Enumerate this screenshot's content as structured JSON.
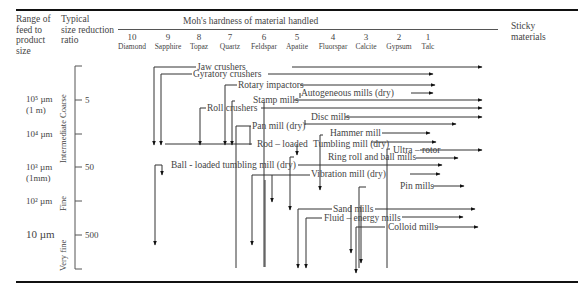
{
  "header": {
    "col1": [
      "Range of",
      "feed to",
      "product",
      "size"
    ],
    "col2": [
      "Typical",
      "size reduction",
      "ratio"
    ],
    "moh_title": "Moh's hardness of material handled",
    "sticky": [
      "Sticky",
      "materials"
    ],
    "hardness": [
      {
        "num": "10",
        "name": "Diamond"
      },
      {
        "num": "9",
        "name": "Sapphire"
      },
      {
        "num": "8",
        "name": "Topaz"
      },
      {
        "num": "7",
        "name": "Quartz"
      },
      {
        "num": "6",
        "name": "Feldspar"
      },
      {
        "num": "5",
        "name": "Apatite"
      },
      {
        "num": "4",
        "name": "Fluorspar"
      },
      {
        "num": "3",
        "name": "Calcite"
      },
      {
        "num": "2",
        "name": "Gypsum"
      },
      {
        "num": "1",
        "name": "Talc"
      }
    ]
  },
  "size_axis": {
    "sizes": [
      {
        "line1": "10⁵ µm",
        "line2": "(1 m)"
      },
      {
        "line1": "10⁴ µm",
        "line2": ""
      },
      {
        "line1": "10³ µm",
        "line2": "(1mm)"
      },
      {
        "line1": "10² µm",
        "line2": ""
      },
      {
        "line1": "10 µm",
        "line2": ""
      }
    ],
    "ratios": [
      "5",
      "50",
      "500"
    ],
    "categories": [
      "Intermediate Coarse",
      "Fine",
      "Very fine"
    ]
  },
  "equipment": [
    "Jaw crushers",
    "Gyratory crushers",
    "Rotary impactors",
    "Autogeneous mills (dry)",
    "Stamp mills",
    "Roll crushers",
    "Disc mills",
    "Pan mill (dry)",
    "Hammer mill",
    "Rod – loaded",
    "Tumbling mill (dry)",
    "Ultra – rotor",
    "Ring roll and ball mills",
    "Ball - loaded tumbling mill (dry)",
    "Vibration mill (dry)",
    "Pin mills",
    "Sand mills",
    "Fluid – energy mills",
    "Colloid mills"
  ]
}
